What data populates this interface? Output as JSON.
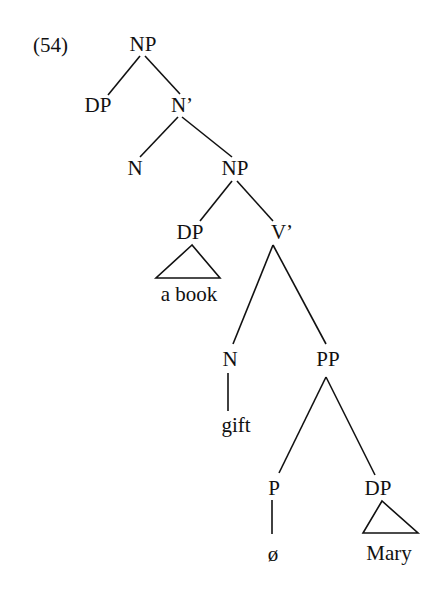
{
  "example_number": "(54)",
  "nodes": {
    "np_root": "NP",
    "dp_spec": "DP",
    "n_bar": "N’",
    "n_head": "N",
    "np_comp": "NP",
    "dp_obj": "DP",
    "v_bar": "V’",
    "n_gift": "N",
    "pp": "PP",
    "p": "P",
    "dp_mary": "DP"
  },
  "leaves": {
    "a_book": "a book",
    "gift": "gift",
    "null_p": "ø",
    "mary": "Mary"
  },
  "colors": {
    "ink": "#111111",
    "background": "#ffffff"
  }
}
